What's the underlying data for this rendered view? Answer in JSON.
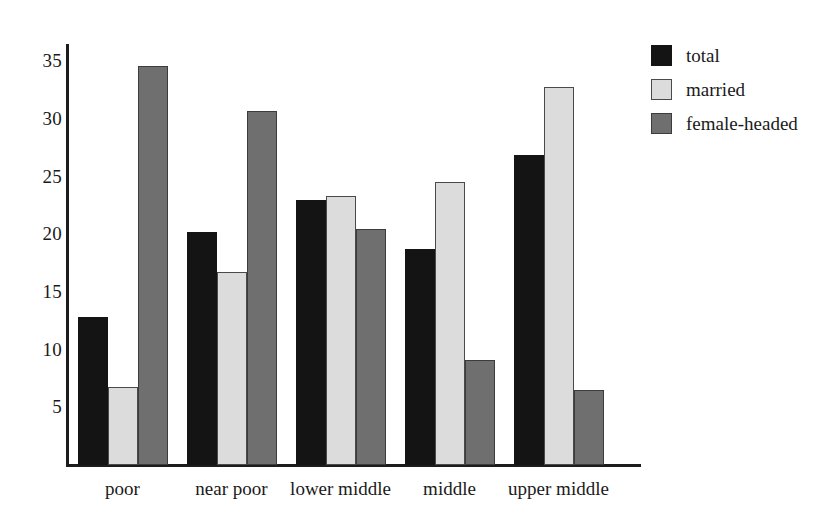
{
  "chart_data": {
    "type": "bar",
    "title": "",
    "xlabel": "",
    "ylabel": "",
    "categories": [
      "poor",
      "near poor",
      "lower middle",
      "middle",
      "upper middle"
    ],
    "series": [
      {
        "name": "total",
        "color": "#141414",
        "values": [
          12.8,
          20.2,
          23.0,
          18.7,
          26.9
        ]
      },
      {
        "name": "married",
        "color": "#dcdcdc",
        "values": [
          6.8,
          16.7,
          23.3,
          24.5,
          32.8
        ]
      },
      {
        "name": "female-headed",
        "color": "#6f6f6f",
        "values": [
          34.6,
          30.7,
          20.5,
          9.1,
          6.5
        ]
      }
    ],
    "ylim": [
      0,
      36.5
    ],
    "yticks": [
      5,
      10,
      15,
      20,
      25,
      30,
      35
    ],
    "ytick_labels": [
      "5",
      "10",
      "15",
      "20",
      "25",
      "30",
      "35"
    ],
    "grid": false,
    "legend_position": "right-top",
    "legend_entries": [
      "total",
      "married",
      "female-headed"
    ]
  },
  "axes": {
    "y_axis_name": "y-axis-line",
    "x_axis_name": "x-axis-line"
  }
}
